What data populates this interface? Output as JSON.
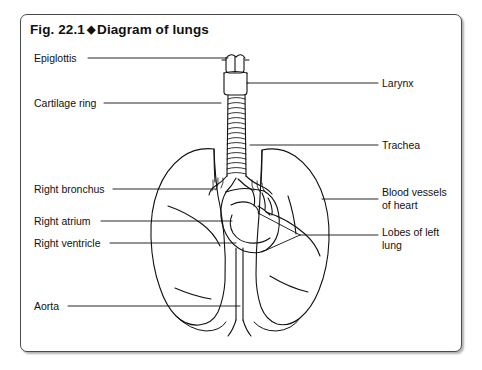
{
  "figure": {
    "number": "Fig. 22.1",
    "separator": "◆",
    "title": "Diagram of lungs",
    "title_full": "Fig. 22.1 ◆ Diagram of lungs"
  },
  "colors": {
    "border": "#4a4a4a",
    "ink": "#111111",
    "background": "#ffffff",
    "leader_line": "#1a1a1a"
  },
  "labels": {
    "left": [
      {
        "text": "Epiglottis",
        "x": 34,
        "y": 54
      },
      {
        "text": "Cartilage ring",
        "x": 34,
        "y": 99
      },
      {
        "text": "Right bronchus",
        "x": 34,
        "y": 185
      },
      {
        "text": "Right atrium",
        "x": 34,
        "y": 217
      },
      {
        "text": "Right ventricle",
        "x": 34,
        "y": 239
      },
      {
        "text": "Aorta",
        "x": 34,
        "y": 302
      }
    ],
    "right": [
      {
        "text": "Larynx",
        "x": 382,
        "y": 79
      },
      {
        "text": "Trachea",
        "x": 382,
        "y": 141
      },
      {
        "text": "Blood vessels\nof heart",
        "x": 382,
        "y": 191
      },
      {
        "text": "Lobes of left\nlung",
        "x": 382,
        "y": 231
      }
    ]
  },
  "diagram": {
    "name": "lungs-anatomy-line-drawing",
    "parts": [
      "epiglottis",
      "larynx",
      "trachea",
      "cartilage-rings",
      "right-bronchus",
      "left-bronchus",
      "right-lung",
      "left-lung",
      "lobe-fissures",
      "heart",
      "right-atrium",
      "right-ventricle",
      "blood-vessels",
      "aorta"
    ]
  }
}
